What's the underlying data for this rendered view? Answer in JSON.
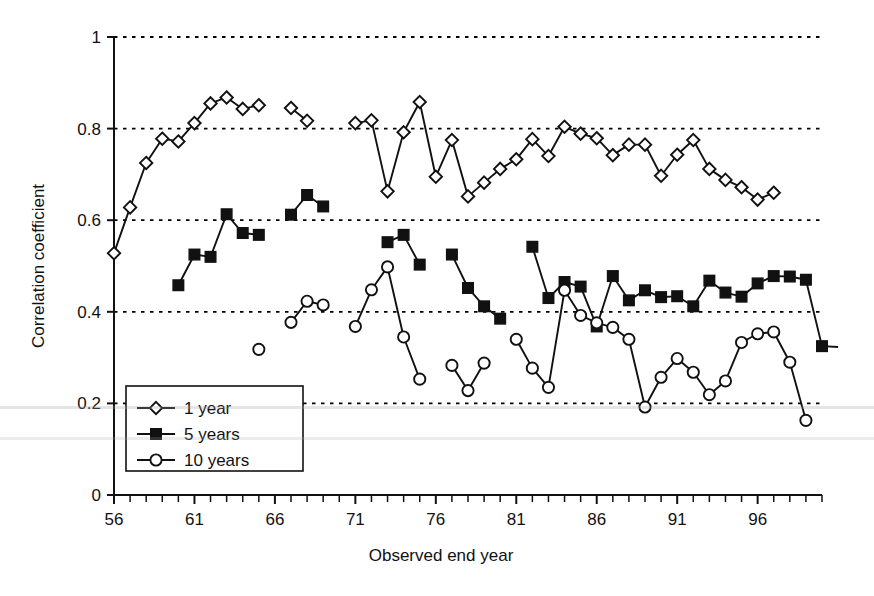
{
  "chart_data": {
    "type": "line",
    "title": "",
    "subtitle": "",
    "xlabel": "Observed end year",
    "ylabel": "Correlation coefficient",
    "xlim": [
      56,
      100
    ],
    "ylim": [
      0,
      1
    ],
    "x_ticks_labeled": [
      56,
      61,
      66,
      71,
      76,
      81,
      86,
      91,
      96
    ],
    "x_tick_step_minor": 1,
    "y_ticks": [
      0,
      0.2,
      0.4,
      0.6,
      0.8,
      1
    ],
    "y_tick_labels": [
      "0",
      "0.2",
      "0.4",
      "0.6",
      "0.8",
      "1"
    ],
    "grid": "horizontal-dotted",
    "legend_position": "lower-left-inside",
    "legend_entries": [
      "1 year",
      "5 years",
      "10 years"
    ],
    "markers": {
      "1 year": "open-diamond",
      "5 years": "filled-square",
      "10 years": "open-circle"
    },
    "series": [
      {
        "name": "1 year",
        "marker": "open-diamond",
        "points": [
          [
            56,
            0.528
          ],
          [
            57,
            0.628
          ],
          [
            58,
            0.725
          ],
          [
            59,
            0.778
          ],
          [
            60,
            0.772
          ],
          [
            61,
            0.812
          ],
          [
            62,
            0.855
          ],
          [
            63,
            0.868
          ],
          [
            64,
            0.843
          ],
          [
            65,
            0.851
          ],
          [
            67,
            0.845
          ],
          [
            68,
            0.817
          ],
          [
            71,
            0.812
          ],
          [
            72,
            0.818
          ],
          [
            73,
            0.663
          ],
          [
            74,
            0.792
          ],
          [
            75,
            0.858
          ],
          [
            76,
            0.695
          ],
          [
            77,
            0.775
          ],
          [
            78,
            0.652
          ],
          [
            79,
            0.682
          ],
          [
            80,
            0.712
          ],
          [
            81,
            0.733
          ],
          [
            82,
            0.777
          ],
          [
            83,
            0.74
          ],
          [
            84,
            0.804
          ],
          [
            85,
            0.789
          ],
          [
            86,
            0.779
          ],
          [
            87,
            0.742
          ],
          [
            88,
            0.765
          ],
          [
            89,
            0.765
          ],
          [
            90,
            0.697
          ],
          [
            91,
            0.743
          ],
          [
            92,
            0.775
          ],
          [
            93,
            0.712
          ],
          [
            94,
            0.688
          ],
          [
            95,
            0.672
          ],
          [
            96,
            0.645
          ],
          [
            97,
            0.66
          ]
        ]
      },
      {
        "name": "5 years",
        "marker": "filled-square",
        "points": [
          [
            60,
            0.458
          ],
          [
            61,
            0.525
          ],
          [
            62,
            0.52
          ],
          [
            63,
            0.613
          ],
          [
            64,
            0.572
          ],
          [
            65,
            0.568
          ],
          [
            67,
            0.612
          ],
          [
            68,
            0.655
          ],
          [
            69,
            0.63
          ],
          [
            73,
            0.552
          ],
          [
            74,
            0.568
          ],
          [
            75,
            0.503
          ],
          [
            77,
            0.525
          ],
          [
            78,
            0.452
          ],
          [
            79,
            0.412
          ],
          [
            80,
            0.385
          ],
          [
            82,
            0.542
          ],
          [
            83,
            0.43
          ],
          [
            84,
            0.465
          ],
          [
            85,
            0.455
          ],
          [
            86,
            0.368
          ],
          [
            87,
            0.478
          ],
          [
            88,
            0.425
          ],
          [
            89,
            0.447
          ],
          [
            90,
            0.432
          ],
          [
            91,
            0.434
          ],
          [
            92,
            0.412
          ],
          [
            93,
            0.468
          ],
          [
            94,
            0.442
          ],
          [
            95,
            0.433
          ],
          [
            96,
            0.462
          ],
          [
            97,
            0.478
          ],
          [
            98,
            0.477
          ],
          [
            99,
            0.47
          ],
          [
            100,
            0.325
          ],
          [
            101,
            0.323
          ]
        ]
      },
      {
        "name": "10 years",
        "marker": "open-circle",
        "points": [
          [
            65,
            0.318
          ],
          [
            67,
            0.377
          ],
          [
            68,
            0.423
          ],
          [
            69,
            0.415
          ],
          [
            71,
            0.368
          ],
          [
            72,
            0.448
          ],
          [
            73,
            0.498
          ],
          [
            74,
            0.345
          ],
          [
            75,
            0.253
          ],
          [
            77,
            0.283
          ],
          [
            78,
            0.228
          ],
          [
            79,
            0.288
          ],
          [
            81,
            0.34
          ],
          [
            82,
            0.277
          ],
          [
            83,
            0.235
          ],
          [
            84,
            0.447
          ],
          [
            85,
            0.392
          ],
          [
            86,
            0.376
          ],
          [
            87,
            0.366
          ],
          [
            88,
            0.34
          ],
          [
            89,
            0.192
          ],
          [
            90,
            0.257
          ],
          [
            91,
            0.298
          ],
          [
            92,
            0.268
          ],
          [
            93,
            0.219
          ],
          [
            94,
            0.249
          ],
          [
            95,
            0.333
          ],
          [
            96,
            0.352
          ],
          [
            97,
            0.356
          ],
          [
            98,
            0.29
          ],
          [
            99,
            0.163
          ]
        ]
      }
    ]
  },
  "axis": {
    "y_title": "Correlation coefficient",
    "x_title": "Observed end year"
  },
  "legend": {
    "items": [
      {
        "label": "1 year",
        "marker": "open-diamond"
      },
      {
        "label": "5 years",
        "marker": "filled-square"
      },
      {
        "label": "10 years",
        "marker": "open-circle"
      }
    ]
  },
  "colors": {
    "line": "#111111",
    "marker_fill_open": "#ffffff",
    "marker_fill_solid": "#111111",
    "grid": "#000000",
    "background": "#ffffff"
  }
}
